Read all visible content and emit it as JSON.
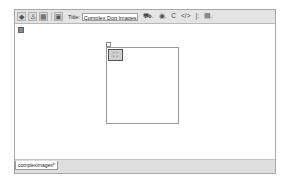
{
  "toolbar": {
    "view_buttons": [
      {
        "name": "code-view",
        "glyph": "◆"
      },
      {
        "name": "split-view",
        "glyph": "♙"
      },
      {
        "name": "design-view",
        "glyph": "▦"
      },
      {
        "name": "live-view",
        "glyph": "▣"
      }
    ],
    "title_label": "Title:",
    "title_value": "Complex Dog Images",
    "tools": [
      {
        "name": "file-management",
        "glyph": "⛟."
      },
      {
        "name": "preview-browser",
        "glyph": "◉."
      },
      {
        "name": "refresh",
        "glyph": "C"
      },
      {
        "name": "code-navigation",
        "glyph": "</>"
      },
      {
        "name": "debug",
        "glyph": "|:"
      },
      {
        "name": "visual-aids",
        "glyph": "▤."
      }
    ]
  },
  "design": {
    "image_placeholder_glyph": "⛶"
  },
  "tabs": [
    {
      "label": "compleximages*"
    }
  ]
}
